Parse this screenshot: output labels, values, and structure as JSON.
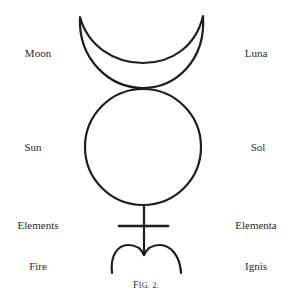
{
  "figure": {
    "caption": "Fig. 2.",
    "caption_first": "F",
    "caption_rest": "IG. 2.",
    "stroke_color": "#1e1e1e"
  },
  "labels_left": [
    {
      "id": "moon",
      "text": "Moon"
    },
    {
      "id": "sun",
      "text": "Sun"
    },
    {
      "id": "elements",
      "text": "Elements"
    },
    {
      "id": "fire",
      "text": "Fire"
    }
  ],
  "labels_right": [
    {
      "id": "luna",
      "text": "Luna"
    },
    {
      "id": "sol",
      "text": "Sol"
    },
    {
      "id": "elementa",
      "text": "Elementa"
    },
    {
      "id": "ignis",
      "text": "Ignis"
    }
  ],
  "symbol_parts": [
    "crescent-moon",
    "sun-circle",
    "elements-cross",
    "fire-sign"
  ]
}
